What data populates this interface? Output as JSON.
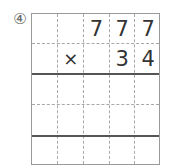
{
  "problem": {
    "label": "④",
    "multiplicand": [
      "",
      "",
      "7",
      "7",
      "7"
    ],
    "multiplier_row": [
      "",
      "×",
      "",
      "3",
      "4"
    ],
    "answer_rows": 3
  }
}
